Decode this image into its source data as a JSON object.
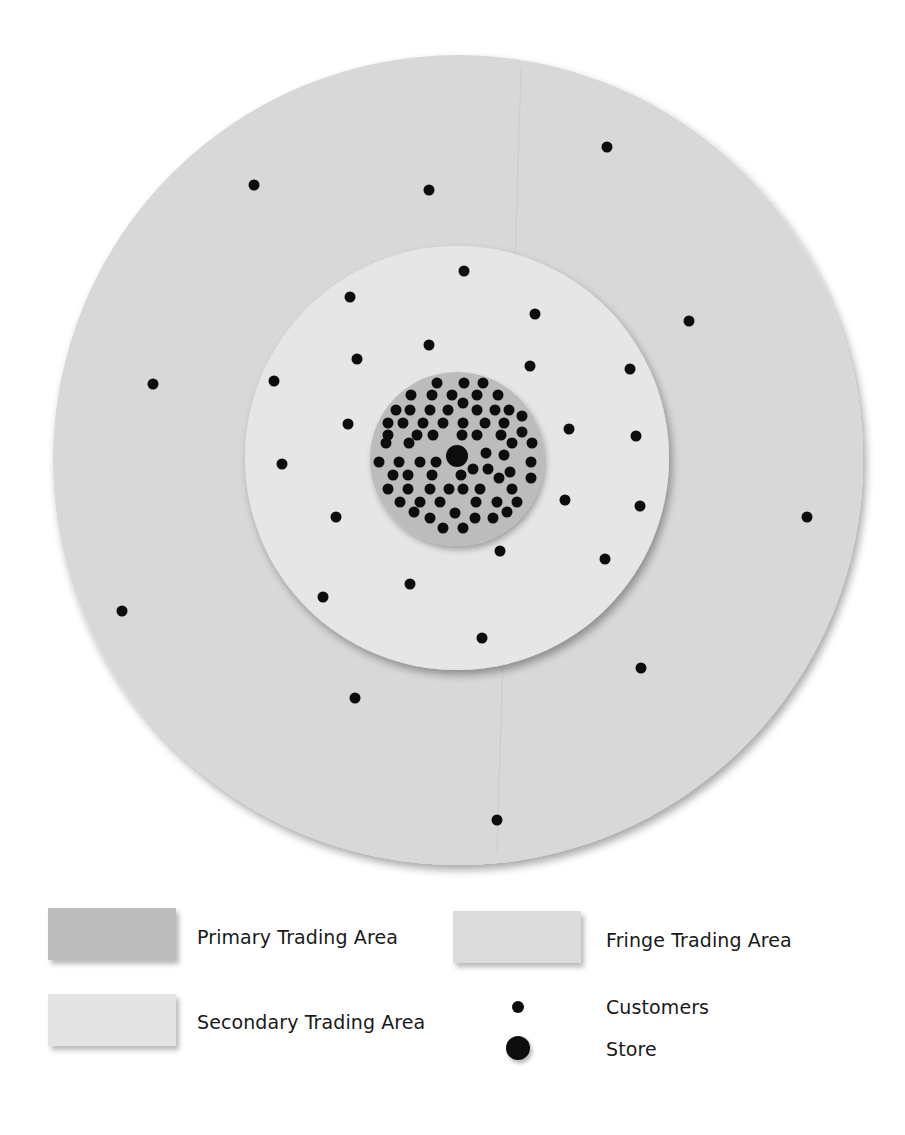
{
  "diagram": {
    "center": [
      457,
      458
    ],
    "areas": {
      "fringe": {
        "label": "Fringe Trading Area",
        "cx": 458,
        "cy": 460,
        "r": 405,
        "color": "#d8d8d8"
      },
      "secondary": {
        "label": "Secondary Trading Area",
        "cx": 457,
        "cy": 458,
        "r": 212,
        "color": "#e6e6e6"
      },
      "primary": {
        "label": "Primary Trading Area",
        "cx": 457,
        "cy": 459,
        "r": 87,
        "color": "#bcbcbc"
      }
    },
    "store": {
      "label": "Store",
      "x": 457,
      "y": 456,
      "r": 11,
      "color": "#0d0d0d"
    },
    "customer_dot_radius": 5.5,
    "customer_color": "#0d0d0d",
    "customers": {
      "fringe": [
        [
          254,
          185
        ],
        [
          429,
          190
        ],
        [
          607,
          147
        ],
        [
          689,
          321
        ],
        [
          153,
          384
        ],
        [
          807,
          517
        ],
        [
          122,
          611
        ],
        [
          641,
          668
        ],
        [
          355,
          698
        ],
        [
          497,
          820
        ]
      ],
      "secondary": [
        [
          464,
          271
        ],
        [
          350,
          297
        ],
        [
          535,
          314
        ],
        [
          429,
          345
        ],
        [
          357,
          359
        ],
        [
          530,
          366
        ],
        [
          630,
          369
        ],
        [
          274,
          381
        ],
        [
          348,
          424
        ],
        [
          569,
          429
        ],
        [
          636,
          436
        ],
        [
          282,
          464
        ],
        [
          565,
          500
        ],
        [
          640,
          506
        ],
        [
          336,
          517
        ],
        [
          500,
          551
        ],
        [
          605,
          559
        ],
        [
          410,
          584
        ],
        [
          323,
          597
        ],
        [
          482,
          638
        ]
      ],
      "primary": [
        [
          437,
          383
        ],
        [
          464,
          383
        ],
        [
          483,
          383
        ],
        [
          411,
          395
        ],
        [
          432,
          395
        ],
        [
          452,
          395
        ],
        [
          477,
          395
        ],
        [
          498,
          395
        ],
        [
          463,
          403
        ],
        [
          396,
          410
        ],
        [
          410,
          410
        ],
        [
          430,
          410
        ],
        [
          448,
          410
        ],
        [
          477,
          410
        ],
        [
          495,
          410
        ],
        [
          509,
          410
        ],
        [
          522,
          416
        ],
        [
          388,
          423
        ],
        [
          403,
          423
        ],
        [
          423,
          423
        ],
        [
          443,
          423
        ],
        [
          463,
          423
        ],
        [
          485,
          423
        ],
        [
          504,
          423
        ],
        [
          522,
          432
        ],
        [
          388,
          435
        ],
        [
          417,
          435
        ],
        [
          433,
          435
        ],
        [
          462,
          435
        ],
        [
          477,
          435
        ],
        [
          501,
          435
        ],
        [
          386,
          443
        ],
        [
          409,
          443
        ],
        [
          512,
          443
        ],
        [
          532,
          443
        ],
        [
          486,
          453
        ],
        [
          504,
          455
        ],
        [
          379,
          462
        ],
        [
          399,
          462
        ],
        [
          420,
          462
        ],
        [
          436,
          462
        ],
        [
          531,
          462
        ],
        [
          473,
          469
        ],
        [
          488,
          469
        ],
        [
          510,
          472
        ],
        [
          393,
          475
        ],
        [
          408,
          475
        ],
        [
          432,
          475
        ],
        [
          461,
          475
        ],
        [
          531,
          478
        ],
        [
          499,
          478
        ],
        [
          388,
          489
        ],
        [
          408,
          489
        ],
        [
          430,
          489
        ],
        [
          449,
          489
        ],
        [
          463,
          489
        ],
        [
          480,
          489
        ],
        [
          512,
          489
        ],
        [
          400,
          502
        ],
        [
          420,
          502
        ],
        [
          440,
          502
        ],
        [
          476,
          502
        ],
        [
          497,
          502
        ],
        [
          517,
          502
        ],
        [
          414,
          512
        ],
        [
          455,
          513
        ],
        [
          507,
          512
        ],
        [
          430,
          518
        ],
        [
          475,
          518
        ],
        [
          493,
          518
        ],
        [
          443,
          528
        ],
        [
          463,
          528
        ]
      ]
    }
  },
  "legend": {
    "items": [
      {
        "key": "primary",
        "label": "Primary Trading Area",
        "type": "swatch",
        "color": "#bcbcbc"
      },
      {
        "key": "fringe",
        "label": "Fringe Trading Area",
        "type": "swatch",
        "color": "#dcdcdc"
      },
      {
        "key": "secondary",
        "label": "Secondary Trading Area",
        "type": "swatch",
        "color": "#e4e4e4"
      },
      {
        "key": "customers",
        "label": "Customers",
        "type": "small-dot",
        "color": "#0d0d0d"
      },
      {
        "key": "store",
        "label": "Store",
        "type": "large-dot",
        "color": "#0d0d0d"
      }
    ]
  }
}
